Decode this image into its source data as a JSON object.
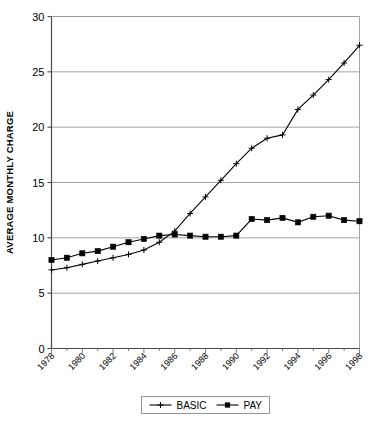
{
  "chart_data": {
    "type": "line",
    "title": "",
    "xlabel": "",
    "ylabel": "AVERAGE MONTHLY CHARGE",
    "ylim": [
      0,
      30
    ],
    "y_ticks": [
      0,
      5,
      10,
      15,
      20,
      25,
      30
    ],
    "y_tick_labels": [
      "0",
      "5",
      "10",
      "15",
      "20",
      "25",
      "30"
    ],
    "grid": "horizontal",
    "legend_position": "bottom",
    "x": [
      1978,
      1979,
      1980,
      1981,
      1982,
      1983,
      1984,
      1985,
      1986,
      1987,
      1988,
      1989,
      1990,
      1991,
      1992,
      1993,
      1994,
      1995,
      1996,
      1997,
      1998
    ],
    "x_tick_labels": [
      "1978",
      "1980",
      "1982",
      "1984",
      "1986",
      "1988",
      "1990",
      "1992",
      "1994",
      "1996",
      "1998"
    ],
    "x_tick_values": [
      1978,
      1980,
      1982,
      1984,
      1986,
      1988,
      1990,
      1992,
      1994,
      1996,
      1998
    ],
    "series": [
      {
        "name": "BASIC",
        "marker": "plus",
        "color": "#000000",
        "values": [
          7.1,
          7.3,
          7.6,
          7.9,
          8.2,
          8.5,
          8.9,
          9.6,
          10.6,
          12.2,
          13.7,
          15.2,
          16.7,
          18.1,
          19.0,
          19.3,
          21.6,
          22.9,
          24.3,
          25.8,
          27.4
        ]
      },
      {
        "name": "PAY",
        "marker": "square",
        "color": "#000000",
        "values": [
          8.0,
          8.2,
          8.6,
          8.8,
          9.2,
          9.6,
          9.9,
          10.2,
          10.3,
          10.2,
          10.1,
          10.1,
          10.2,
          11.7,
          11.6,
          11.8,
          11.4,
          11.9,
          12.0,
          11.6,
          11.5
        ]
      }
    ]
  },
  "legend": {
    "entries": [
      {
        "label": "BASIC",
        "marker": "plus"
      },
      {
        "label": "PAY",
        "marker": "square"
      }
    ]
  }
}
